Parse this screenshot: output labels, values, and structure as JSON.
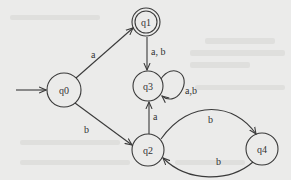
{
  "diagram": {
    "type": "finite-automaton",
    "start_state": "q0",
    "accepting_states": [
      "q1"
    ],
    "states": [
      {
        "id": "q0",
        "label": "q0",
        "x": 64,
        "y": 90,
        "r": 17,
        "accepting": false,
        "start": true
      },
      {
        "id": "q1",
        "label": "q1",
        "x": 146,
        "y": 22,
        "r": 14,
        "accepting": true,
        "start": false
      },
      {
        "id": "q3",
        "label": "q3",
        "x": 148,
        "y": 86,
        "r": 15,
        "accepting": false,
        "start": false
      },
      {
        "id": "q2",
        "label": "q2",
        "x": 148,
        "y": 150,
        "r": 16,
        "accepting": false,
        "start": false
      },
      {
        "id": "q4",
        "label": "q4",
        "x": 262,
        "y": 149,
        "r": 16,
        "accepting": false,
        "start": false
      }
    ],
    "transitions": [
      {
        "from": "q0",
        "to": "q1",
        "label": "a"
      },
      {
        "from": "q0",
        "to": "q2",
        "label": "b"
      },
      {
        "from": "q1",
        "to": "q3",
        "label": "a, b"
      },
      {
        "from": "q3",
        "to": "q3",
        "label": "a,b"
      },
      {
        "from": "q2",
        "to": "q3",
        "label": "a"
      },
      {
        "from": "q2",
        "to": "q4",
        "label": "b"
      },
      {
        "from": "q4",
        "to": "q2",
        "label": "b"
      }
    ]
  },
  "labels": {
    "q0": "q0",
    "q1": "q1",
    "q2": "q2",
    "q3": "q3",
    "q4": "q4",
    "e_q0_q1": "a",
    "e_q0_q2": "b",
    "e_q1_q3": "a, b",
    "e_q3_loop": "a,b",
    "e_q2_q3": "a",
    "e_q2_q4": "b",
    "e_q4_q2": "b"
  }
}
